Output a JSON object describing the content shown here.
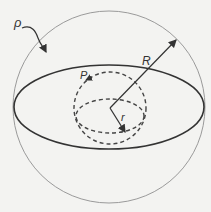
{
  "diagram": {
    "labels": {
      "density": "ρ",
      "outer_radius": "R",
      "point": "P",
      "inner_radius": "r"
    },
    "colors": {
      "outer_sphere": "#9a9a9a",
      "equator": "#333333",
      "inner_dashed": "#444444",
      "background": "#f3f3f1"
    }
  }
}
